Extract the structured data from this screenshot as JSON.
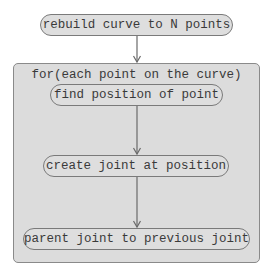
{
  "diagram": {
    "start_node": {
      "label": "rebuild curve to N points"
    },
    "loop": {
      "label": "for(each point on the curve)",
      "steps": [
        {
          "label": "find position of point"
        },
        {
          "label": "create joint at position"
        },
        {
          "label": "parent joint to previous joint"
        }
      ]
    },
    "edges": [
      {
        "from": "rebuild curve to N points",
        "to": "for(each point on the curve)"
      },
      {
        "from": "find position of point",
        "to": "create joint at position"
      },
      {
        "from": "create joint at position",
        "to": "parent joint to previous joint"
      }
    ],
    "colors": {
      "node_fill": "#dedede",
      "container_fill": "#dcdcdc",
      "border": "#7a7a7a",
      "text": "#3a3a3a",
      "arrow": "#6a6a6a"
    }
  }
}
